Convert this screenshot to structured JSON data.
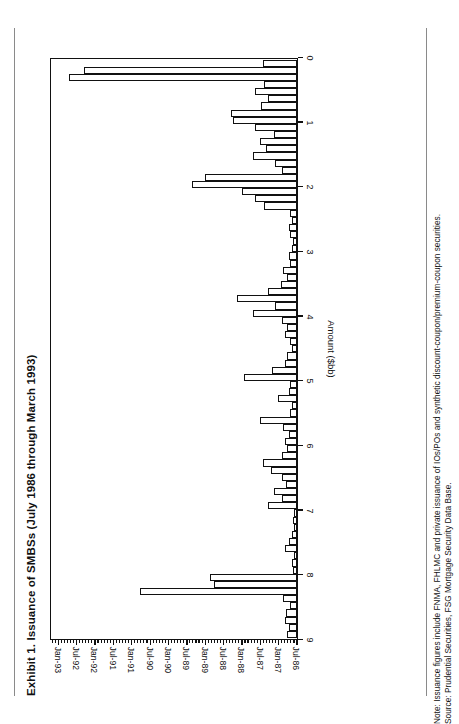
{
  "exhibit": {
    "title": "Exhibit 1.   Issuance of SMBSs (July 1986 through March 1993)"
  },
  "notes": {
    "note": "Note: Issuance figures include FNMA, FHLMC and private issuance of IOs/POs and synthetic discount-coupon/premium-coupon securities.",
    "source": "Source:  Prudential Securities, FSG Mortgage Security Data Base."
  },
  "chart_data": {
    "type": "bar",
    "title": "Exhibit 1.   Issuance of SMBSs (July 1986 through March 1993)",
    "orientation": "horizontal-rotated-page",
    "xlabel": "",
    "ylabel": "Amount ($bb)",
    "ylim": [
      0,
      9
    ],
    "yticks": [
      9,
      8,
      7,
      6,
      5,
      4,
      3,
      2,
      1,
      0
    ],
    "ytick_labels": [
      "9",
      "8",
      "7",
      "6",
      "5",
      "4",
      "3",
      "2",
      "1",
      "0"
    ],
    "grid": false,
    "legend": null,
    "bar_style": {
      "fill": "#ffffff",
      "edge": "#111111"
    },
    "axis_labels": [
      "Jul-86",
      "Jan-87",
      "Jul-87",
      "Jan-88",
      "Jul-88",
      "Jan-89",
      "Jul-89",
      "Jan-90",
      "Jul-90",
      "Jan-91",
      "Jul-91",
      "Jan-92",
      "Jul-92",
      "Jan-93"
    ],
    "categories": [
      "Jul-86",
      "Aug-86",
      "Sep-86",
      "Oct-86",
      "Nov-86",
      "Dec-86",
      "Jan-87",
      "Feb-87",
      "Mar-87",
      "Apr-87",
      "May-87",
      "Jun-87",
      "Jul-87",
      "Aug-87",
      "Sep-87",
      "Oct-87",
      "Nov-87",
      "Dec-87",
      "Jan-88",
      "Feb-88",
      "Mar-88",
      "Apr-88",
      "May-88",
      "Jun-88",
      "Jul-88",
      "Aug-88",
      "Sep-88",
      "Oct-88",
      "Nov-88",
      "Dec-88",
      "Jan-89",
      "Feb-89",
      "Mar-89",
      "Apr-89",
      "May-89",
      "Jun-89",
      "Jul-89",
      "Aug-89",
      "Sep-89",
      "Oct-89",
      "Nov-89",
      "Dec-89",
      "Jan-90",
      "Feb-90",
      "Mar-90",
      "Apr-90",
      "May-90",
      "Jun-90",
      "Jul-90",
      "Aug-90",
      "Sep-90",
      "Oct-90",
      "Nov-90",
      "Dec-90",
      "Jan-91",
      "Feb-91",
      "Mar-91",
      "Apr-91",
      "May-91",
      "Jun-91",
      "Jul-91",
      "Aug-91",
      "Sep-91",
      "Oct-91",
      "Nov-91",
      "Dec-91",
      "Jan-92",
      "Feb-92",
      "Mar-92",
      "Apr-92",
      "May-92",
      "Jun-92",
      "Jul-92",
      "Aug-92",
      "Sep-92",
      "Oct-92",
      "Nov-92",
      "Dec-92",
      "Jan-93",
      "Feb-93",
      "Mar-93"
    ],
    "values": [
      0.35,
      0.3,
      0.45,
      0.4,
      0.25,
      0.5,
      5.75,
      3.05,
      3.2,
      0.15,
      0.2,
      0.1,
      0.45,
      0.3,
      0.2,
      0.1,
      0.15,
      0.1,
      1.05,
      0.55,
      0.85,
      0.4,
      0.55,
      0.95,
      1.25,
      0.55,
      0.35,
      0.45,
      0.3,
      0.5,
      1.35,
      0.25,
      0.2,
      0.7,
      0.3,
      0.25,
      1.95,
      0.9,
      0.45,
      0.35,
      0.2,
      0.25,
      0.45,
      0.35,
      0.55,
      1.6,
      0.8,
      2.2,
      1.05,
      0.6,
      0.35,
      0.5,
      0.25,
      0.3,
      0.2,
      0.15,
      0.25,
      0.3,
      0.2,
      0.25,
      1.2,
      1.55,
      2.0,
      3.85,
      3.35,
      0.55,
      0.8,
      1.6,
      1.15,
      1.35,
      0.85,
      1.55,
      2.35,
      2.4,
      1.3,
      1.05,
      1.55,
      1.2,
      8.35,
      7.8,
      1.25
    ]
  }
}
